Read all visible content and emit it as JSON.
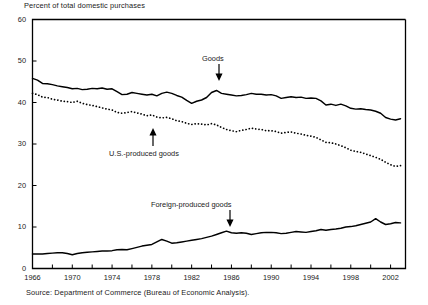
{
  "figure": {
    "axis_title": "Percent of total domestic purchases",
    "source_note": "Source:  Department of Commerce (Bureau of Economic Analysis)."
  },
  "annotations": {
    "goods": "Goods",
    "us_produced": "U.S.-produced goods",
    "foreign_produced": "Foreign-produced goods"
  },
  "chart_data": {
    "type": "line",
    "title": "Percent of total domestic purchases",
    "xlabel": "",
    "ylabel": "Percent of total domestic purchases",
    "xlim": [
      1966,
      2003.5
    ],
    "ylim": [
      0,
      60
    ],
    "ytick_labels": [
      "0",
      "10",
      "20",
      "30",
      "40",
      "50",
      "60"
    ],
    "yticks": [
      0,
      10,
      20,
      30,
      40,
      50,
      60
    ],
    "xtick_labels": [
      "1966",
      "1970",
      "1974",
      "1978",
      "1982",
      "1986",
      "1990",
      "1994",
      "1998",
      "2002"
    ],
    "xticks": [
      1966,
      1970,
      1974,
      1978,
      1982,
      1986,
      1990,
      1994,
      1998,
      2002
    ],
    "xtick_minor_interval": 2,
    "grid": false,
    "legend": "annotated-arrows",
    "line_color": "#000000",
    "series": [
      {
        "name": "Goods",
        "style": "solid",
        "x": [
          1966,
          1966.5,
          1967,
          1967.5,
          1968,
          1968.5,
          1969,
          1969.5,
          1970,
          1970.5,
          1971,
          1971.5,
          1972,
          1972.5,
          1973,
          1973.5,
          1974,
          1974.5,
          1975,
          1975.5,
          1976,
          1976.5,
          1977,
          1977.5,
          1978,
          1978.5,
          1979,
          1979.5,
          1980,
          1980.5,
          1981,
          1981.5,
          1982,
          1982.5,
          1983,
          1983.5,
          1984,
          1984.5,
          1985,
          1985.5,
          1986,
          1986.5,
          1987,
          1987.5,
          1988,
          1988.5,
          1989,
          1989.5,
          1990,
          1990.5,
          1991,
          1991.5,
          1992,
          1992.5,
          1993,
          1993.5,
          1994,
          1994.5,
          1995,
          1995.5,
          1996,
          1996.5,
          1997,
          1997.5,
          1998,
          1998.5,
          1999,
          1999.5,
          2000,
          2000.5,
          2001,
          2001.5,
          2002,
          2002.5,
          2003
        ],
        "values": [
          45.8,
          45.4,
          44.6,
          44.5,
          44.3,
          44.0,
          43.8,
          43.6,
          43.3,
          43.4,
          43.1,
          43.2,
          43.4,
          43.3,
          43.5,
          43.2,
          43.3,
          42.6,
          41.9,
          42.0,
          42.4,
          42.2,
          42.0,
          41.8,
          42.0,
          41.6,
          42.2,
          42.5,
          42.2,
          41.7,
          41.3,
          40.5,
          39.8,
          40.3,
          40.6,
          41.2,
          42.4,
          42.9,
          42.2,
          42.0,
          41.8,
          41.6,
          41.7,
          41.9,
          42.2,
          42.0,
          42.0,
          41.8,
          41.9,
          41.6,
          41.0,
          41.2,
          41.4,
          41.2,
          41.3,
          41.0,
          41.1,
          41.0,
          40.4,
          39.4,
          39.6,
          39.3,
          39.6,
          39.2,
          38.6,
          38.4,
          38.5,
          38.3,
          38.2,
          37.9,
          37.4,
          36.4,
          36.0,
          35.8,
          36.1
        ]
      },
      {
        "name": "U.S.-produced goods",
        "style": "dotted",
        "x": [
          1966,
          1966.5,
          1967,
          1967.5,
          1968,
          1968.5,
          1969,
          1969.5,
          1970,
          1970.5,
          1971,
          1971.5,
          1972,
          1972.5,
          1973,
          1973.5,
          1974,
          1974.5,
          1975,
          1975.5,
          1976,
          1976.5,
          1977,
          1977.5,
          1978,
          1978.5,
          1979,
          1979.5,
          1980,
          1980.5,
          1981,
          1981.5,
          1982,
          1982.5,
          1983,
          1983.5,
          1984,
          1984.5,
          1985,
          1985.5,
          1986,
          1986.5,
          1987,
          1987.5,
          1988,
          1988.5,
          1989,
          1989.5,
          1990,
          1990.5,
          1991,
          1991.5,
          1992,
          1992.5,
          1993,
          1993.5,
          1994,
          1994.5,
          1995,
          1995.5,
          1996,
          1996.5,
          1997,
          1997.5,
          1998,
          1998.5,
          1999,
          1999.5,
          2000,
          2000.5,
          2001,
          2001.5,
          2002,
          2002.5,
          2003
        ],
        "values": [
          42.2,
          41.9,
          41.3,
          41.2,
          40.8,
          40.6,
          40.3,
          40.2,
          40.0,
          40.3,
          39.8,
          39.5,
          39.3,
          39.0,
          38.7,
          38.4,
          38.2,
          37.6,
          37.4,
          37.6,
          37.8,
          37.5,
          37.2,
          36.8,
          37.0,
          36.5,
          36.3,
          36.4,
          36.1,
          35.6,
          35.4,
          35.0,
          34.7,
          34.9,
          34.8,
          34.6,
          34.9,
          34.6,
          34.0,
          33.5,
          33.2,
          33.0,
          33.3,
          33.5,
          33.8,
          33.6,
          33.5,
          33.2,
          33.2,
          33.0,
          32.6,
          32.8,
          32.9,
          32.6,
          32.4,
          32.1,
          31.9,
          31.6,
          31.0,
          30.4,
          30.3,
          30.0,
          29.6,
          29.1,
          28.5,
          28.2,
          28.0,
          27.6,
          27.2,
          26.8,
          26.3,
          25.6,
          25.0,
          24.6,
          24.8
        ]
      },
      {
        "name": "Foreign-produced goods",
        "style": "solid",
        "x": [
          1966,
          1966.5,
          1967,
          1967.5,
          1968,
          1968.5,
          1969,
          1969.5,
          1970,
          1970.5,
          1971,
          1971.5,
          1972,
          1972.5,
          1973,
          1973.5,
          1974,
          1974.5,
          1975,
          1975.5,
          1976,
          1976.5,
          1977,
          1977.5,
          1978,
          1978.5,
          1979,
          1979.5,
          1980,
          1980.5,
          1981,
          1981.5,
          1982,
          1982.5,
          1983,
          1983.5,
          1984,
          1984.5,
          1985,
          1985.5,
          1986,
          1986.5,
          1987,
          1987.5,
          1988,
          1988.5,
          1989,
          1989.5,
          1990,
          1990.5,
          1991,
          1991.5,
          1992,
          1992.5,
          1993,
          1993.5,
          1994,
          1994.5,
          1995,
          1995.5,
          1996,
          1996.5,
          1997,
          1997.5,
          1998,
          1998.5,
          1999,
          1999.5,
          2000,
          2000.5,
          2001,
          2001.5,
          2002,
          2002.5,
          2003
        ],
        "values": [
          3.5,
          3.5,
          3.5,
          3.6,
          3.7,
          3.8,
          3.8,
          3.6,
          3.3,
          3.6,
          3.8,
          3.9,
          4.0,
          4.1,
          4.2,
          4.2,
          4.3,
          4.5,
          4.6,
          4.5,
          4.8,
          5.1,
          5.4,
          5.6,
          5.8,
          6.4,
          7.0,
          6.6,
          6.1,
          6.2,
          6.4,
          6.6,
          6.8,
          7.0,
          7.2,
          7.5,
          7.8,
          8.2,
          8.6,
          9.0,
          8.6,
          8.5,
          8.6,
          8.5,
          8.2,
          8.4,
          8.6,
          8.7,
          8.7,
          8.6,
          8.4,
          8.5,
          8.7,
          8.9,
          8.8,
          8.7,
          8.9,
          9.1,
          9.4,
          9.2,
          9.4,
          9.5,
          9.7,
          10.0,
          10.1,
          10.3,
          10.6,
          10.9,
          11.2,
          12.0,
          11.2,
          10.6,
          10.8,
          11.1,
          11.0
        ]
      }
    ]
  }
}
